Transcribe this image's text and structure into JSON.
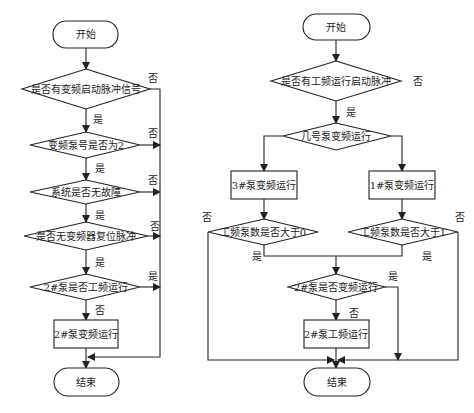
{
  "left_flowchart": {
    "start": "开始",
    "d1": "是否有变频启动脉冲信号",
    "d2": "变频泵号是否为2",
    "d3": "系统是否无故障",
    "d4": "是否无变频器复位脉冲",
    "d5": "2#泵是否工频运行",
    "p1": "2#泵变频运行",
    "end": "结束",
    "labels": {
      "d1_no": "否",
      "d1_yes": "是",
      "d2_no": "否",
      "d2_yes": "是",
      "d3_no": "否",
      "d3_yes": "是",
      "d4_no": "否",
      "d4_yes": "是",
      "d5_yes": "是",
      "d5_no": "否"
    }
  },
  "right_flowchart": {
    "start": "开始",
    "d1": "是否有工频运行启动脉冲",
    "d2": "几号泵变频运行",
    "p_left": "3#泵变频运行",
    "p_right": "1#泵变频运行",
    "d_left": "工频泵数是否大于0",
    "d_right": "工频泵数是否大于1",
    "d3": "2#泵是否变频运行",
    "p2": "2#泵工频运行",
    "end": "结束",
    "labels": {
      "d1_no": "否",
      "d1_yes": "是",
      "d_left_no": "否",
      "d_left_yes": "是",
      "d_right_no": "否",
      "d_right_yes": "是",
      "d3_yes": "是",
      "d3_no": "否"
    }
  }
}
